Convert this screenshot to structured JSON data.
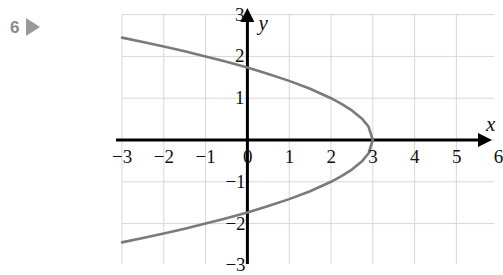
{
  "marker": {
    "number": "6",
    "play_icon": "play-triangle-icon"
  },
  "colors": {
    "curve": "#7a7a7a",
    "axis": "#000000",
    "grid": "#d7d7d7",
    "tick_label": "#111111",
    "marker": "#8a8a8a",
    "background": "#ffffff"
  },
  "chart_data": {
    "type": "line",
    "title": "",
    "xlabel": "x",
    "ylabel": "y",
    "xlim": [
      -3,
      6.15
    ],
    "ylim": [
      -3,
      3
    ],
    "xticks": [
      -3,
      -2,
      -1,
      0,
      1,
      2,
      3,
      4,
      5,
      6
    ],
    "xtick_labels": [
      "−3",
      "−2",
      "−1",
      "0",
      "1",
      "2",
      "3",
      "4",
      "5",
      "6"
    ],
    "yticks": [
      -3,
      -2,
      -1,
      1,
      2,
      3
    ],
    "ytick_labels": [
      "−3",
      "−2",
      "−1",
      "1",
      "2",
      "3"
    ],
    "grid": true,
    "grid_spacing": 1,
    "legend": null,
    "axis_arrows": [
      "x-positive",
      "y-positive"
    ],
    "series": [
      {
        "name": "parabola",
        "equation": "x = 3 − y²",
        "vertex": [
          3,
          0
        ],
        "opens": "left",
        "x_intercept": 3,
        "y_intercepts": [
          1.732,
          -1.732
        ],
        "points": [
          [
            -3.0,
            2.449
          ],
          [
            -2.5,
            2.345
          ],
          [
            -2.0,
            2.236
          ],
          [
            -1.5,
            2.121
          ],
          [
            -1.0,
            2.0
          ],
          [
            -0.5,
            1.871
          ],
          [
            0.0,
            1.732
          ],
          [
            0.5,
            1.581
          ],
          [
            1.0,
            1.414
          ],
          [
            1.5,
            1.225
          ],
          [
            2.0,
            1.0
          ],
          [
            2.25,
            0.866
          ],
          [
            2.5,
            0.707
          ],
          [
            2.75,
            0.5
          ],
          [
            2.9,
            0.316
          ],
          [
            3.0,
            0.0
          ],
          [
            2.9,
            -0.316
          ],
          [
            2.75,
            -0.5
          ],
          [
            2.5,
            -0.707
          ],
          [
            2.25,
            -0.866
          ],
          [
            2.0,
            -1.0
          ],
          [
            1.5,
            -1.225
          ],
          [
            1.0,
            -1.414
          ],
          [
            0.5,
            -1.581
          ],
          [
            0.0,
            -1.732
          ],
          [
            -0.5,
            -1.871
          ],
          [
            -1.0,
            -2.0
          ],
          [
            -1.5,
            -2.121
          ],
          [
            -2.0,
            -2.236
          ],
          [
            -2.5,
            -2.345
          ],
          [
            -3.0,
            -2.449
          ]
        ]
      }
    ]
  }
}
